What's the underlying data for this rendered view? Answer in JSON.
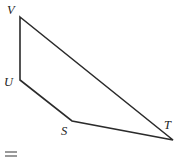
{
  "figure": {
    "kind": "geometry-quadrilateral",
    "canvas": {
      "width": 178,
      "height": 162,
      "background": "#ffffff"
    },
    "stroke": {
      "color": "#2b2b2b",
      "width": 1.6,
      "linejoin": "miter",
      "linecap": "round"
    },
    "vertices": [
      {
        "id": "V",
        "label": "V",
        "x": 20,
        "y": 17,
        "label_x": 7,
        "label_y": 4
      },
      {
        "id": "T",
        "label": "T",
        "x": 173,
        "y": 140,
        "label_x": 164,
        "label_y": 119
      },
      {
        "id": "S",
        "label": "S",
        "x": 72,
        "y": 121,
        "label_x": 61,
        "label_y": 125
      },
      {
        "id": "U",
        "label": "U",
        "x": 20,
        "y": 80,
        "label_x": 4,
        "label_y": 76
      }
    ],
    "outline_path": "M 20 17 L 173 140 L 72 121 L 20 80 Z",
    "edges": [
      {
        "from": "V",
        "to": "T"
      },
      {
        "from": "T",
        "to": "S"
      },
      {
        "from": "S",
        "to": "U"
      },
      {
        "from": "U",
        "to": "V"
      }
    ],
    "label_style": {
      "italic": true,
      "font_size_px": 12.5,
      "color": "#1d1d1d"
    }
  },
  "artifact": {
    "name": "equals-mark",
    "color": "#9a9a9a",
    "x": 5,
    "y": 151,
    "width": 12,
    "height": 7
  }
}
